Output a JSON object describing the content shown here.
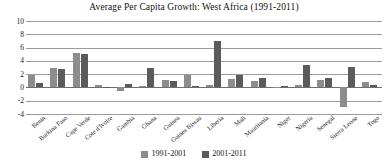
{
  "chart_data": {
    "type": "bar",
    "title": "Average Per Capita Growth: West Africa (1991-2011)",
    "xlabel": "",
    "ylabel": "",
    "ylim": [
      -4,
      10
    ],
    "yticks": [
      10,
      8,
      6,
      4,
      2,
      0,
      -2,
      -4
    ],
    "grid": true,
    "legend_position": "bottom",
    "categories": [
      "Benin",
      "Burkina Faso",
      "Cape Verde",
      "Cote d'Ivoire",
      "Gambia",
      "Ghana",
      "Guinea",
      "Guinea Bissau",
      "Liberia",
      "Mali",
      "Mauritania",
      "Niger",
      "Nigeria",
      "Senegal",
      "Sierra Leone",
      "Togo"
    ],
    "series": [
      {
        "name": "1991-2001",
        "color": "#8d8d8d",
        "values": [
          1.8,
          3.0,
          5.2,
          0.4,
          -0.6,
          0.2,
          1.1,
          1.9,
          0.3,
          1.3,
          0.9,
          0.1,
          0.4,
          1.1,
          -3.0,
          0.8
        ]
      },
      {
        "name": "2001-2011",
        "color": "#5b5b5b",
        "values": [
          0.7,
          2.8,
          5.0,
          0.1,
          0.5,
          3.0,
          1.0,
          0.2,
          7.0,
          1.9,
          1.4,
          0.2,
          3.4,
          1.4,
          3.1,
          0.4
        ]
      }
    ]
  },
  "legend": {
    "items": [
      {
        "label": "1991-2001",
        "color": "#8d8d8d"
      },
      {
        "label": "2001-2011",
        "color": "#5b5b5b"
      }
    ]
  }
}
